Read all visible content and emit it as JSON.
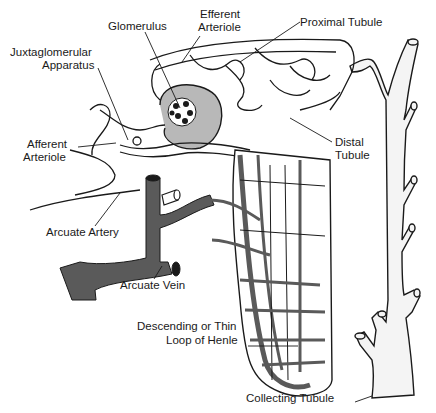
{
  "diagram": {
    "type": "anatomical-illustration",
    "colors": {
      "ink": "#1a1a1a",
      "vessel": "#5a5a5a",
      "background": "#ffffff"
    },
    "labels": {
      "glomerulus": "Glomerulus",
      "efferent_arteriole_1": "Efferent",
      "efferent_arteriole_2": "Arteriole",
      "proximal_tubule": "Proximal Tubule",
      "juxtaglomerular_1": "Juxtaglomerular",
      "juxtaglomerular_2": "Apparatus",
      "afferent_arteriole_1": "Afferent",
      "afferent_arteriole_2": "Arteriole",
      "distal_tubule_1": "Distal",
      "distal_tubule_2": "Tubule",
      "arcuate_artery": "Arcuate Artery",
      "arcuate_vein": "Arcuate Vein",
      "loop_of_henle_1": "Descending or Thin",
      "loop_of_henle_2": "Loop of Henle",
      "collecting_tubule": "Collecting Tubule"
    }
  }
}
